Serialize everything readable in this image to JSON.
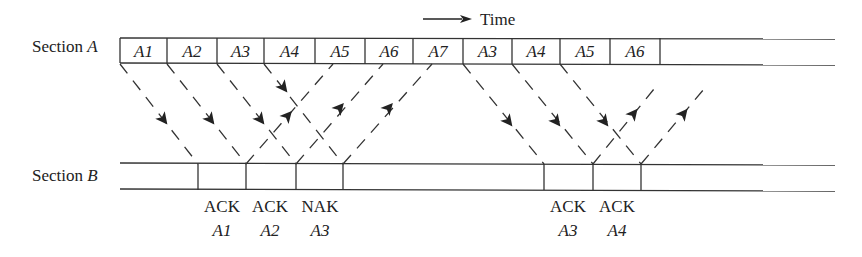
{
  "time_label": "Time",
  "section_a": {
    "label": "Section",
    "label_var": "A",
    "cells": [
      {
        "text": "A1",
        "x0": 120,
        "x1": 167
      },
      {
        "text": "A2",
        "x0": 167,
        "x1": 217
      },
      {
        "text": "A3",
        "x0": 217,
        "x1": 264
      },
      {
        "text": "A4",
        "x0": 264,
        "x1": 315
      },
      {
        "text": "A5",
        "x0": 315,
        "x1": 365
      },
      {
        "text": "A6",
        "x0": 365,
        "x1": 413
      },
      {
        "text": "A7",
        "x0": 413,
        "x1": 463
      },
      {
        "text": "A3",
        "x0": 463,
        "x1": 512
      },
      {
        "text": "A4",
        "x0": 512,
        "x1": 560
      },
      {
        "text": "A5",
        "x0": 560,
        "x1": 610
      },
      {
        "text": "A6",
        "x0": 610,
        "x1": 660
      }
    ]
  },
  "section_b": {
    "label": "Section",
    "label_var": "B",
    "boundaries": [
      198,
      246,
      296,
      343,
      544,
      593,
      641
    ]
  },
  "responses": [
    {
      "type": "ACK",
      "frame": "A1",
      "x": 222
    },
    {
      "type": "ACK",
      "frame": "A2",
      "x": 270
    },
    {
      "type": "NAK",
      "frame": "A3",
      "x": 320
    },
    {
      "type": "ACK",
      "frame": "A3",
      "x": 568
    },
    {
      "type": "ACK",
      "frame": "A4",
      "x": 617
    }
  ]
}
